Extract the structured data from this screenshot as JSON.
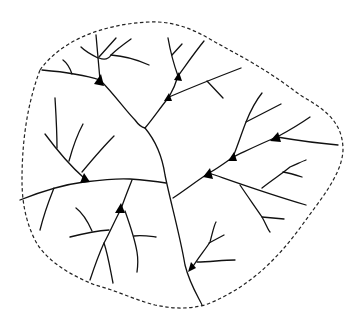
{
  "diagram": {
    "title": "",
    "description": "Dendritic branching network enclosed by a dashed boundary with triangular junction markers",
    "colors": {
      "stroke": "#111111",
      "boundary": "#222222",
      "node": "#000000",
      "background": "#ffffff"
    },
    "node_count": 8,
    "nodes": [
      {
        "id": "n1",
        "x": 100,
        "y": 80
      },
      {
        "id": "n2",
        "x": 178,
        "y": 76
      },
      {
        "id": "n3",
        "x": 169,
        "y": 97
      },
      {
        "id": "n4",
        "x": 277,
        "y": 137
      },
      {
        "id": "n5",
        "x": 233,
        "y": 157
      },
      {
        "id": "n6",
        "x": 209,
        "y": 173
      },
      {
        "id": "n7",
        "x": 84,
        "y": 178
      },
      {
        "id": "n8",
        "x": 121,
        "y": 209
      },
      {
        "id": "n9",
        "x": 192,
        "y": 268
      }
    ]
  }
}
